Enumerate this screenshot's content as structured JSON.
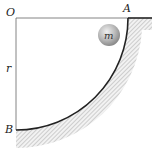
{
  "diagram": {
    "labels": {
      "origin": "O",
      "top_point": "A",
      "bottom_point": "B",
      "radius": "r",
      "mass": "m"
    },
    "colors": {
      "line": "#222222",
      "thin_line": "#555555",
      "hatch": "#bbbbbb",
      "ball_light": "#e6e6e6",
      "ball_dark": "#8a8a8a"
    }
  }
}
